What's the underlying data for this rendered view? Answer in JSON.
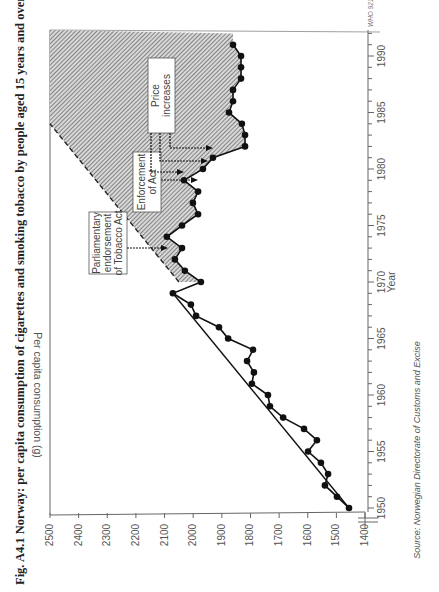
{
  "figure": {
    "title": "Fig. A4.1  Norway: per capita consumption of cigarettes and smoking tobacco by people aged 15 years and over",
    "source": "Source: Norwegian Directorate of Customs and Excise",
    "code": "WHO 921060",
    "orientation": "rotated 90° clockwise (read with page turned)"
  },
  "annotations": [
    {
      "label_lines": [
        "Parliamentary",
        "endorsement",
        "of Tobacco Act"
      ],
      "year": 1973
    },
    {
      "label_lines": [
        "Enforcement",
        "of Act"
      ],
      "year": 1978
    },
    {
      "label_lines": [
        "Price",
        "increases"
      ],
      "years": [
        1980,
        1981,
        1982
      ]
    }
  ],
  "chart_data": {
    "type": "line",
    "title": "Norway: per capita consumption of cigarettes and smoking tobacco by people aged 15 years and over",
    "xlabel": "Year",
    "ylabel": "Per capita consumption (g)",
    "xlim": [
      1950,
      1992
    ],
    "ylim": [
      1400,
      2500
    ],
    "x_ticks": [
      "1950",
      "1955",
      "1960",
      "1965",
      "1970",
      "1975",
      "1980",
      "1985",
      "1990"
    ],
    "y_ticks": [
      "1400",
      "1500",
      "1600",
      "1700",
      "1800",
      "1900",
      "2000",
      "2100",
      "2200",
      "2300",
      "2400",
      "2500"
    ],
    "grid": false,
    "y_axis_break": true,
    "series": [
      {
        "name": "Per capita consumption",
        "style": "line with filled circle markers",
        "x": [
          1950,
          1951,
          1952,
          1953,
          1954,
          1955,
          1956,
          1957,
          1958,
          1959,
          1960,
          1961,
          1962,
          1963,
          1964,
          1965,
          1966,
          1967,
          1968,
          1969,
          1970,
          1971,
          1972,
          1973,
          1974,
          1975,
          1976,
          1977,
          1978,
          1979,
          1980,
          1981,
          1982,
          1983,
          1984,
          1985,
          1986,
          1987,
          1988,
          1989,
          1990,
          1991
        ],
        "values": [
          1456,
          1498,
          1540,
          1529,
          1554,
          1599,
          1568,
          1613,
          1686,
          1732,
          1739,
          1795,
          1788,
          1812,
          1791,
          1878,
          1910,
          1990,
          2008,
          2071,
          1973,
          2029,
          2064,
          2039,
          2092,
          2039,
          1983,
          2001,
          1983,
          2032,
          1966,
          1931,
          1819,
          1819,
          1830,
          1875,
          1861,
          1861,
          1833,
          1833,
          1833,
          1861
        ]
      },
      {
        "name": "Trend 1950-1969",
        "style": "straight line",
        "x": [
          1950,
          1969
        ],
        "values": [
          1456,
          2071
        ]
      },
      {
        "name": "Projected trend (dashed) / shaded gap",
        "style": "dashed line bounding hatched area",
        "x": [
          1970,
          1984
        ],
        "values": [
          2050,
          2500
        ]
      }
    ]
  }
}
